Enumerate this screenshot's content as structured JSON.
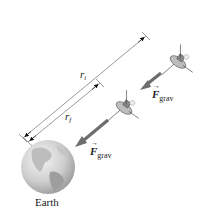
{
  "diagram": {
    "title": "",
    "planet": {
      "label": "Earth",
      "icon": "earth-globe"
    },
    "distances": [
      {
        "id": "ri",
        "symbol": "r",
        "subscript": "i"
      },
      {
        "id": "rf",
        "symbol": "r",
        "subscript": "f"
      }
    ],
    "forces": [
      {
        "symbol": "F",
        "subscript": "grav",
        "vector_hat": "→"
      },
      {
        "symbol": "F",
        "subscript": "grav",
        "vector_hat": "→"
      }
    ],
    "satellites": [
      {
        "id": "initial",
        "icon": "satellite"
      },
      {
        "id": "final",
        "icon": "satellite"
      }
    ],
    "colors": {
      "line": "#555555",
      "arrow": "#6e6e6e",
      "earth_light": "#e9e9e9",
      "earth_dark": "#9a9a9a",
      "text": "#222222"
    }
  }
}
